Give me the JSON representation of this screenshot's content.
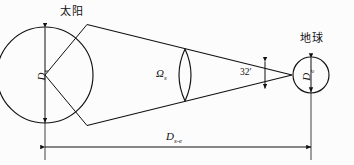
{
  "figure": {
    "type": "diagram",
    "background_color": "#fcfcfc",
    "stroke_color": "#111111"
  },
  "labels": {
    "sun": "太阳",
    "earth": "地球",
    "sun_diameter": "D",
    "sun_diameter_sub": "s",
    "earth_diameter": "D",
    "earth_diameter_sub": "e",
    "solid_angle": "Ω",
    "solid_angle_sub": "s",
    "angle_value": "32′",
    "distance": "D",
    "distance_sub": "s-e"
  },
  "geometry": {
    "sun_center_x": 45,
    "sun_center_y": 75,
    "sun_radius": 48,
    "earth_center_x": 311,
    "earth_center_y": 75,
    "earth_radius": 18,
    "apex_x": 292,
    "apex_y": 75,
    "lens_center_x": 185,
    "lens_half_height": 26,
    "dimension_line_y": 147,
    "angle_tick_x": 265
  }
}
